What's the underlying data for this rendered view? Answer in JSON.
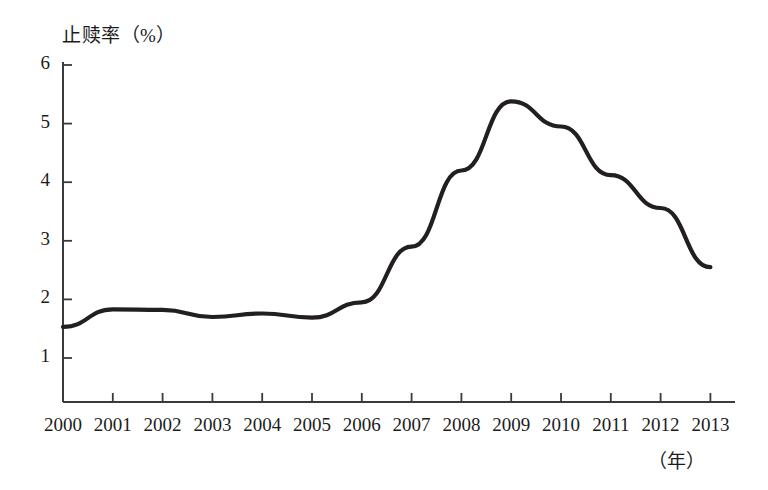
{
  "chart_data": {
    "type": "line",
    "title": "止赎率（%）",
    "ylabel": "止赎率（%）",
    "xlabel": "（年）",
    "categories": [
      "2000",
      "2001",
      "2002",
      "2003",
      "2004",
      "2005",
      "2006",
      "2007",
      "2008",
      "2009",
      "2010",
      "2011",
      "2012",
      "2013"
    ],
    "values": [
      1.53,
      1.83,
      1.82,
      1.7,
      1.76,
      1.69,
      1.95,
      2.9,
      4.2,
      5.38,
      4.95,
      4.12,
      3.56,
      2.55
    ],
    "series": [
      {
        "name": "止赎率",
        "values": [
          1.53,
          1.83,
          1.82,
          1.7,
          1.76,
          1.69,
          1.95,
          2.9,
          4.2,
          5.38,
          4.95,
          4.12,
          3.56,
          2.55
        ]
      }
    ],
    "ylim": [
      0,
      6
    ],
    "ytick_labels": [
      "6",
      "5",
      "4",
      "3",
      "2",
      "1"
    ],
    "ytick_values": [
      6,
      5,
      4,
      3,
      2,
      1
    ],
    "grid": false,
    "legend": "none",
    "line_color": "#231f20",
    "axis_color": "#3a3a3a"
  },
  "axis": {
    "y_title": "止赎率（%）",
    "x_unit": "（年）"
  }
}
